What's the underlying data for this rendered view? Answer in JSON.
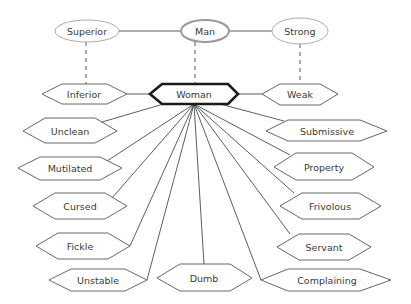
{
  "diagram": {
    "top_nodes": [
      {
        "id": "superior",
        "label": "Superior"
      },
      {
        "id": "man",
        "label": "Man"
      },
      {
        "id": "strong",
        "label": "Strong"
      }
    ],
    "center_node": {
      "id": "woman",
      "label": "Woman"
    },
    "side_nodes": [
      {
        "id": "inferior",
        "label": "Inferior"
      },
      {
        "id": "weak",
        "label": "Weak"
      }
    ],
    "left_nodes": [
      {
        "id": "unclean",
        "label": "Unclean"
      },
      {
        "id": "mutilated",
        "label": "Mutilated"
      },
      {
        "id": "cursed",
        "label": "Cursed"
      },
      {
        "id": "fickle",
        "label": "Fickle"
      },
      {
        "id": "unstable",
        "label": "Unstable"
      }
    ],
    "bottom_node": {
      "id": "dumb",
      "label": "Dumb"
    },
    "right_nodes": [
      {
        "id": "submissive",
        "label": "Submissive"
      },
      {
        "id": "property",
        "label": "Property"
      },
      {
        "id": "frivolous",
        "label": "Frivolous"
      },
      {
        "id": "servant",
        "label": "Servant"
      },
      {
        "id": "complaining",
        "label": "Complaining"
      }
    ]
  }
}
